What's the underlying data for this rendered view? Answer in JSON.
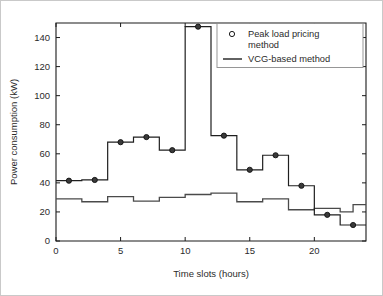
{
  "chart_data": {
    "type": "line",
    "title": "",
    "subtitle": "",
    "xlabel": "Time slots (hours)",
    "ylabel": "Power consumption (kW)",
    "xlim": [
      0,
      24
    ],
    "ylim": [
      0,
      150
    ],
    "xticks": [
      0,
      5,
      10,
      15,
      20
    ],
    "yticks": [
      0,
      20,
      40,
      60,
      80,
      100,
      120,
      140
    ],
    "xticklabels": [
      "0",
      "5",
      "10",
      "15",
      "20"
    ],
    "yticklabels": [
      "0",
      "20",
      "40",
      "60",
      "80",
      "100",
      "120",
      "140"
    ],
    "grid": false,
    "drawstyle": "steps-post",
    "legend_position": "upper right",
    "legend_entries": [
      {
        "label": "Peak load pricing method",
        "marker": "circle",
        "style": "marker"
      },
      {
        "label": "VCG-based method",
        "marker": "none",
        "style": "line"
      }
    ],
    "x": [
      0,
      1,
      2,
      3,
      4,
      5,
      6,
      7,
      8,
      9,
      10,
      11,
      12,
      13,
      14,
      15,
      16,
      17,
      18,
      19,
      20,
      21,
      22,
      23,
      24
    ],
    "series": [
      {
        "name": "Peak load pricing method",
        "marker": "circle",
        "marker_x": [
          1,
          3,
          5,
          7,
          9,
          11,
          13,
          15,
          17,
          19,
          21,
          23
        ],
        "marker_y": [
          41.5,
          42,
          68,
          71.5,
          62.5,
          147.5,
          72.5,
          49,
          59,
          38,
          18,
          11
        ],
        "values": [
          41.5,
          41.5,
          42,
          42,
          68,
          68,
          71.5,
          71.5,
          62.5,
          62.5,
          147.5,
          147.5,
          72.5,
          72.5,
          49,
          49,
          59,
          59,
          38,
          38,
          18,
          18,
          11,
          11,
          11
        ]
      },
      {
        "name": "VCG-based method",
        "marker": "none",
        "values": [
          29,
          29,
          27,
          27,
          30.5,
          30.5,
          27.5,
          27.5,
          30,
          30,
          32,
          32,
          33,
          33,
          27,
          27,
          29,
          29,
          21.5,
          21.5,
          22.5,
          22.5,
          20,
          25,
          25
        ]
      }
    ]
  },
  "axes": {
    "xlabel": "Time slots (hours)",
    "ylabel": "Power consumption (kW)"
  },
  "legend": {
    "entry_1_line_1": "Peak load pricing",
    "entry_1_line_2": "method",
    "entry_2": "VCG-based method"
  },
  "colors": {
    "peak_series": "#1f1f1f",
    "vcg_series": "#4a4a4a",
    "axis": "#1a1a1a",
    "background": "#ffffff",
    "frame": "#c9c9c9"
  }
}
